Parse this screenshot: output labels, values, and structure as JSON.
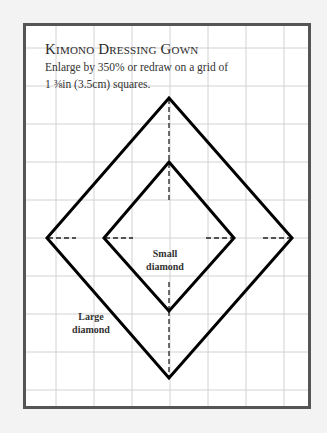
{
  "pattern": {
    "title": "Kimono Dressing Gown",
    "instructions": {
      "line1": "Enlarge by 350% or redraw on a grid of",
      "line2": "1 ⅜in (3.5cm) squares."
    },
    "labels": {
      "small_line1": "Small",
      "small_line2": "diamond",
      "large_line1": "Large",
      "large_line2": "diamond"
    },
    "grid": {
      "square_size_in": "1 ⅜in",
      "square_size_cm": "3.5cm",
      "enlarge_percent": "350%"
    },
    "colors": {
      "frame": "#555555",
      "grid": "#cfcfcf",
      "outline": "#000000",
      "background": "#ffffff"
    }
  }
}
